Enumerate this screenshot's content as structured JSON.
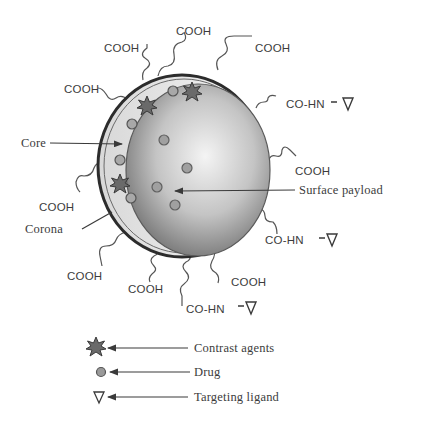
{
  "diagram": {
    "colors": {
      "background": "#ffffff",
      "line": "#3a3a3a",
      "sphere_light": "#f2f2f2",
      "sphere_dark": "#6e6e6e",
      "drug_fill": "#9a9a9a",
      "contrast_fill": "#6a6a6a",
      "text": "#3c3c3c"
    },
    "surface_groups": [
      {
        "id": "g1",
        "label": "COOH"
      },
      {
        "id": "g2",
        "label": "COOH"
      },
      {
        "id": "g3",
        "label": "COOH"
      },
      {
        "id": "g4",
        "label": "COOH"
      },
      {
        "id": "g5",
        "label": "CO-HN"
      },
      {
        "id": "g6",
        "label": "COOH"
      },
      {
        "id": "g7",
        "label": "CO-HN"
      },
      {
        "id": "g8",
        "label": "COOH"
      },
      {
        "id": "g9",
        "label": "COOH"
      },
      {
        "id": "g10",
        "label": "COOH"
      },
      {
        "id": "g11",
        "label": "CO-HN"
      },
      {
        "id": "g12",
        "label": "COOH"
      }
    ],
    "callouts": {
      "core": "Core",
      "corona": "Corona",
      "surface_payload": "Surface payload"
    },
    "legend": [
      {
        "icon": "contrast-agent-star-icon",
        "label": "Contrast agents"
      },
      {
        "icon": "drug-circle-icon",
        "label": "Drug"
      },
      {
        "icon": "targeting-ligand-triangle-icon",
        "label": "Targeting ligand"
      }
    ]
  }
}
